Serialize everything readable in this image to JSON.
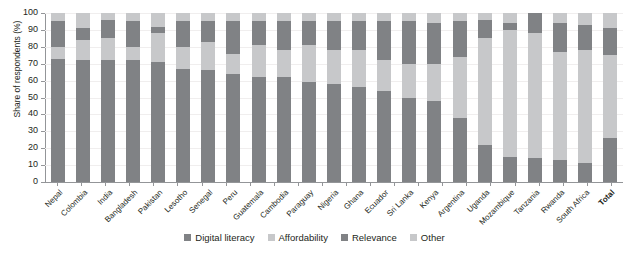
{
  "chart_data": {
    "type": "bar",
    "subtype": "stacked-percentage-column",
    "title": "",
    "xlabel": "",
    "ylabel": "Share of respondents (%)",
    "ylim": [
      0,
      100
    ],
    "yticks": [
      0,
      10,
      20,
      30,
      40,
      50,
      60,
      70,
      80,
      90,
      100
    ],
    "grid": true,
    "legend_position": "bottom",
    "stack_order_bottom_to_top": [
      "Digital literacy",
      "Affordability",
      "Relevance",
      "Other"
    ],
    "categories": [
      "Nepal",
      "Colombia",
      "India",
      "Bangladesh",
      "Pakistan",
      "Lesotho",
      "Senegal",
      "Peru",
      "Guatemala",
      "Cambodia",
      "Paraguay",
      "Nigeria",
      "Ghana",
      "Ecuador",
      "Sri Lanka",
      "Kenya",
      "Argentina",
      "Uganda",
      "Mozambique",
      "Tanzania",
      "Rwanda",
      "South Africa",
      "Total"
    ],
    "series": [
      {
        "name": "Digital literacy",
        "color": "#808285",
        "values": [
          73,
          72,
          72,
          72,
          71,
          67,
          66,
          64,
          62,
          62,
          59,
          58,
          56,
          54,
          50,
          48,
          38,
          22,
          15,
          14,
          13,
          11,
          26
        ]
      },
      {
        "name": "Affordability",
        "color": "#c7c8ca",
        "values": [
          7,
          12,
          13,
          8,
          17,
          13,
          17,
          12,
          19,
          16,
          22,
          20,
          22,
          18,
          20,
          22,
          36,
          63,
          75,
          74,
          64,
          67,
          49
        ]
      },
      {
        "name": "Relevance",
        "color": "#808285",
        "values": [
          15,
          7,
          11,
          15,
          4,
          15,
          12,
          19,
          14,
          17,
          14,
          17,
          17,
          23,
          25,
          24,
          21,
          11,
          4,
          12,
          17,
          15,
          16
        ]
      },
      {
        "name": "Other",
        "color": "#c7c8ca",
        "values": [
          5,
          9,
          4,
          5,
          8,
          5,
          5,
          5,
          5,
          5,
          5,
          5,
          5,
          5,
          5,
          6,
          5,
          4,
          6,
          0,
          6,
          7,
          9
        ]
      }
    ]
  },
  "legend": {
    "items": [
      {
        "label": "Digital literacy",
        "color": "#808285"
      },
      {
        "label": "Affordability",
        "color": "#c7c8ca"
      },
      {
        "label": "Relevance",
        "color": "#808285"
      },
      {
        "label": "Other",
        "color": "#c7c8ca"
      }
    ]
  }
}
